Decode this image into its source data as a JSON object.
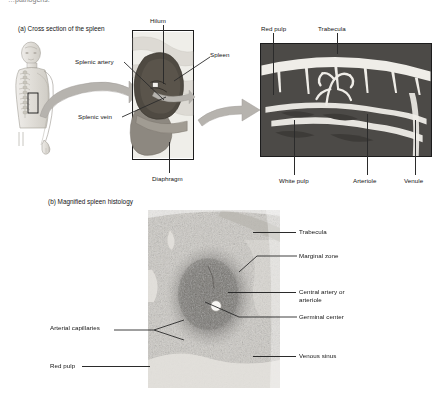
{
  "page": {
    "header_text": "…pathogens."
  },
  "panel_a": {
    "title": "(a) Cross section of the spleen",
    "labels": {
      "splenic_artery": "Splenic artery",
      "splenic_vein": "Splenic vein",
      "hilum": "Hilum",
      "spleen": "Spleen",
      "diaphragm": "Diaphragm",
      "red_pulp": "Red pulp",
      "trabecula": "Trabecula",
      "white_pulp": "White pulp",
      "arteriole": "Arteriole",
      "venule": "Venule"
    }
  },
  "panel_b": {
    "title": "(b) Magnified spleen histology",
    "labels": {
      "trabecula": "Trabecula",
      "marginal_zone": "Marginal zone",
      "central_artery_line1": "Central artery or",
      "central_artery_line2": "arteriole",
      "germinal_center": "Germinal center",
      "venous_sinus": "Venous sinus",
      "arterial_capillaries": "Arterial capillaries",
      "red_pulp": "Red pulp"
    }
  },
  "colors": {
    "ink": "#141414",
    "leader": "#2b2b2b",
    "arrow_gray": "#b3b0ab",
    "spleen_dark": "#555048",
    "spleen_mid": "#7d776d",
    "pulp_dark": "#4a4a4a",
    "pulp_light": "#e6e4df",
    "micrograph_base": "#d9d6d1",
    "body_tint": "#d8d5cf"
  }
}
